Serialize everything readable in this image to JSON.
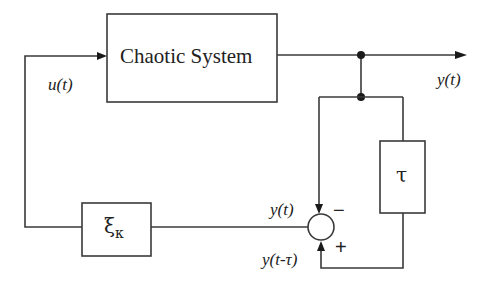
{
  "diagram": {
    "type": "block-diagram",
    "blocks": {
      "system": {
        "label": "Chaotic System"
      },
      "delay": {
        "label": "τ"
      },
      "controller": {
        "label": "ξ",
        "subscript": "κ"
      }
    },
    "signals": {
      "input": "u(t)",
      "output": "y(t)",
      "sum_top": "y(t)",
      "sum_bottom": "y(t-τ)"
    },
    "summing_junction": {
      "top_sign": "−",
      "bottom_sign": "+"
    },
    "colors": {
      "line": "#3a3a3a",
      "background": "#ffffff"
    }
  }
}
